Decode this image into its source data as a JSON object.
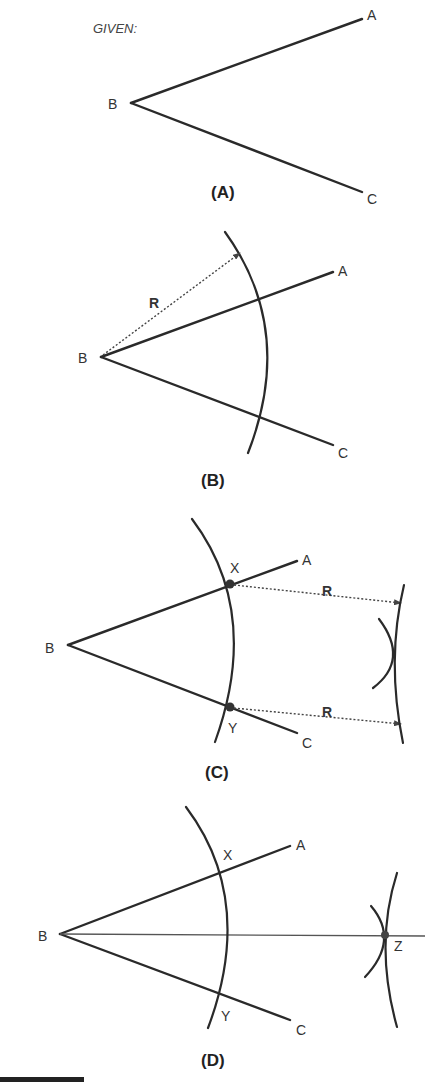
{
  "given_label": "GIVEN:",
  "panels": [
    {
      "id": "A",
      "caption": "(A)",
      "points": {
        "A": "A",
        "B": "B",
        "C": "C"
      }
    },
    {
      "id": "B",
      "caption": "(B)",
      "points": {
        "A": "A",
        "B": "B",
        "C": "C"
      },
      "radius_label": "R"
    },
    {
      "id": "C",
      "caption": "(C)",
      "points": {
        "A": "A",
        "B": "B",
        "C": "C",
        "X": "X",
        "Y": "Y"
      },
      "radius_labels": [
        "R",
        "R"
      ]
    },
    {
      "id": "D",
      "caption": "(D)",
      "points": {
        "A": "A",
        "B": "B",
        "C": "C",
        "X": "X",
        "Y": "Y",
        "Z": "Z"
      }
    }
  ],
  "colors": {
    "line": "#2a2a2a",
    "text": "#333333",
    "background": "#ffffff"
  }
}
